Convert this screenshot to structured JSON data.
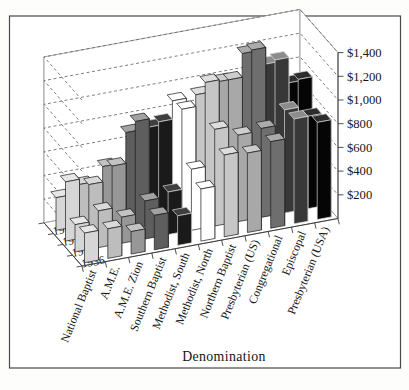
{
  "chart_data": {
    "type": "bar",
    "projection": "3d",
    "title": "",
    "xlabel": "Denomination",
    "ylabel": "",
    "legend": "none",
    "grid": "dashed",
    "value_axis": {
      "min": 0,
      "max": 1400,
      "step": 200,
      "prefix": "$",
      "tick_labels": [
        "$200",
        "$400",
        "$600",
        "$800",
        "$1,000",
        "$1,200",
        "$1,400"
      ],
      "position": "right"
    },
    "categories": [
      "National Baptist",
      "A.M.E.",
      "A.M.E. Zion",
      "Southern Baptist",
      "Methodist, South",
      "Methodist, North",
      "Northern Baptist",
      "Presbyterian (US)",
      "Congregational",
      "Episcopal",
      "Presbyterian (USA)"
    ],
    "depth_categories": [
      "1906",
      "1916",
      "1926",
      "1936"
    ],
    "series": [
      {
        "name": "1906",
        "values": [
          275,
          350,
          465,
          715,
          725,
          910,
          925,
          1000,
          1200,
          1075,
          880
        ]
      },
      {
        "name": "1916",
        "values": [
          500,
          440,
          560,
          900,
          860,
          930,
          1120,
          1105,
          1320,
          1200,
          1000
        ]
      },
      {
        "name": "1926",
        "values": [
          230,
          310,
          220,
          320,
          360,
          515,
          815,
          730,
          750,
          870,
          780
        ]
      },
      {
        "name": "1936",
        "values": [
          250,
          250,
          190,
          290,
          250,
          440,
          690,
          670,
          730,
          885,
          820
        ]
      }
    ],
    "category_colors": [
      "#d6d6d6",
      "#bdbdbd",
      "#979797",
      "#5e5e5e",
      "#1a1a1a",
      "#ffffff",
      "#c6c6c6",
      "#a8a8a8",
      "#6e6e6e",
      "#383838",
      "#050505"
    ],
    "colors": {
      "background": "#ffffff",
      "border": "#4a4a4a",
      "text": "#141414",
      "gridline": "#6f6f6f"
    }
  }
}
